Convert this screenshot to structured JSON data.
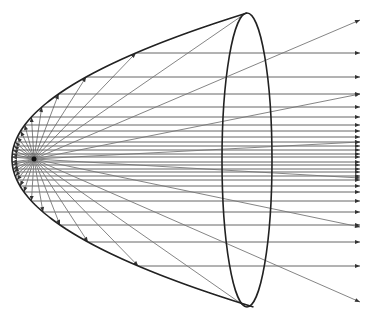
{
  "diagram": {
    "colors": {
      "background": "#ffffff",
      "mirror": "#222222",
      "rays": "#777777",
      "arrowheads": "#333333"
    },
    "focus": {
      "x": 34,
      "y": 159
    },
    "vertex": {
      "x": 12,
      "y": 159
    },
    "rim": {
      "cx": 247,
      "cy": 160,
      "rx": 25,
      "ry": 147
    },
    "arrow_end_x": 360,
    "reflected_ray_y": [
      53,
      77,
      94,
      107,
      117,
      125,
      131,
      137,
      142,
      146,
      150,
      154,
      157,
      162,
      165,
      169,
      172,
      176,
      180,
      186,
      192,
      201,
      212,
      225,
      242,
      266
    ],
    "direct_rays": [
      {
        "x": 246,
        "y": 13
      },
      {
        "x": 360,
        "y": 20
      },
      {
        "x": 360,
        "y": 94
      },
      {
        "x": 360,
        "y": 142
      },
      {
        "x": 360,
        "y": 178
      },
      {
        "x": 360,
        "y": 227
      },
      {
        "x": 360,
        "y": 302
      },
      {
        "x": 246,
        "y": 307
      }
    ]
  }
}
